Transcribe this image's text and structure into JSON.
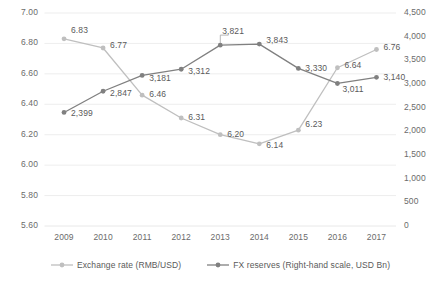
{
  "chart_data": {
    "type": "line",
    "title": "",
    "xlabel": "",
    "ylabel": "",
    "categories": [
      "2009",
      "2010",
      "2011",
      "2012",
      "2013",
      "2014",
      "2015",
      "2016",
      "2017"
    ],
    "grid": true,
    "legend_position": "bottom",
    "series": [
      {
        "name": "Exchange rate (RMB/USD)",
        "axis": "left",
        "color": "#bfbfbf",
        "marker": "circle",
        "values": [
          6.83,
          6.77,
          6.46,
          6.31,
          6.2,
          6.14,
          6.23,
          6.64,
          6.76
        ],
        "value_labels": [
          "6.83",
          "6.77",
          "6.46",
          "6.31",
          "6.20",
          "6.14",
          "6.23",
          "6.64",
          "6.76"
        ]
      },
      {
        "name": "FX reserves (Right-hand scale, USD Bn)",
        "axis": "right",
        "color": "#808080",
        "marker": "circle",
        "values": [
          2399,
          2847,
          3181,
          3312,
          3821,
          3843,
          3330,
          3011,
          3140
        ],
        "value_labels": [
          "2,399",
          "2,847",
          "3,181",
          "3,312",
          "3,821",
          "3,843",
          "3,330",
          "3,011",
          "3,140"
        ]
      }
    ],
    "y_left": {
      "ticks": [
        7.0,
        6.8,
        6.6,
        6.4,
        6.2,
        6.0,
        5.8,
        5.6
      ],
      "tick_labels": [
        "7.00",
        "6.80",
        "6.60",
        "6.40",
        "6.20",
        "6.00",
        "5.80",
        "5.60"
      ],
      "ylim": [
        5.6,
        7.0
      ]
    },
    "y_right": {
      "ticks": [
        4500,
        4000,
        3500,
        3000,
        2500,
        2000,
        1500,
        1000,
        500,
        0
      ],
      "tick_labels": [
        "4,500",
        "4,000",
        "3,500",
        "3,000",
        "2,500",
        "2,000",
        "1,500",
        "1,000",
        "500",
        "0"
      ],
      "ylim": [
        0,
        4500
      ]
    }
  },
  "legend": {
    "items": [
      {
        "label": "Exchange rate (RMB/USD)",
        "color": "#bfbfbf"
      },
      {
        "label": "FX reserves (Right-hand scale, USD Bn)",
        "color": "#808080"
      }
    ]
  },
  "colors": {
    "exchange_rate": "#bfbfbf",
    "fx_reserves": "#808080",
    "grid": "#e8e8e8",
    "text": "#5a5a5a",
    "background": "#ffffff"
  }
}
